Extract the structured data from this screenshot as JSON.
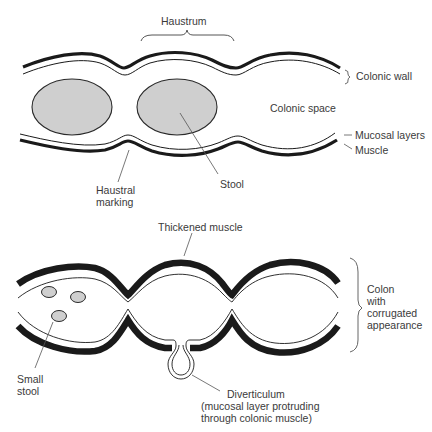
{
  "top_diagram": {
    "labels": {
      "haustrum": "Haustrum",
      "colonic_wall": "Colonic wall",
      "colonic_space": "Colonic space",
      "mucosal_layers": "Mucosal layers",
      "muscle": "Muscle",
      "stool": "Stool",
      "haustral_marking_line1": "Haustral",
      "haustral_marking_line2": "marking"
    }
  },
  "bottom_diagram": {
    "labels": {
      "thickened_muscle": "Thickened muscle",
      "colon_line1": "Colon",
      "colon_line2": "with",
      "colon_line3": "corrugated",
      "colon_line4": "appearance",
      "small_stool_line1": "Small",
      "small_stool_line2": "stool",
      "diverticulum_line1": "Diverticulum",
      "diverticulum_line2": "(mucosal layer protruding",
      "diverticulum_line3": "through colonic muscle)"
    }
  },
  "colors": {
    "muscle": "#1a1a1a",
    "stool_fill": "#cfcfcf",
    "stroke": "#2a2a2a",
    "leader": "#555555"
  }
}
